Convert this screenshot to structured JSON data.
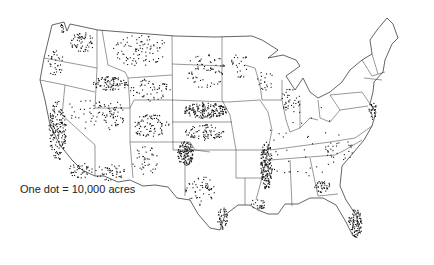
{
  "map": {
    "type": "dot-density",
    "region": "Contiguous United States",
    "legend": {
      "text": "One dot = 10,000 acres"
    },
    "colors": {
      "dots": "#111111",
      "borders": "#222222",
      "background": "#ffffff"
    },
    "clusters": [
      {
        "name": "washington-columbia-basin",
        "cx": 82,
        "cy": 42,
        "rx": 12,
        "ry": 10,
        "n": 60
      },
      {
        "name": "puget-sound",
        "cx": 63,
        "cy": 28,
        "rx": 4,
        "ry": 5,
        "n": 12
      },
      {
        "name": "oregon-willamette",
        "cx": 55,
        "cy": 62,
        "rx": 8,
        "ry": 14,
        "n": 35
      },
      {
        "name": "idaho-snake-river",
        "cx": 110,
        "cy": 83,
        "rx": 18,
        "ry": 7,
        "n": 90
      },
      {
        "name": "montana",
        "cx": 140,
        "cy": 50,
        "rx": 28,
        "ry": 16,
        "n": 90
      },
      {
        "name": "wyoming",
        "cx": 150,
        "cy": 90,
        "rx": 20,
        "ry": 12,
        "n": 55
      },
      {
        "name": "california-central-valley",
        "cx": 57,
        "cy": 130,
        "rx": 9,
        "ry": 30,
        "n": 170
      },
      {
        "name": "california-south",
        "cx": 80,
        "cy": 170,
        "rx": 12,
        "ry": 8,
        "n": 40
      },
      {
        "name": "nevada",
        "cx": 85,
        "cy": 110,
        "rx": 18,
        "ry": 18,
        "n": 35
      },
      {
        "name": "utah",
        "cx": 112,
        "cy": 115,
        "rx": 12,
        "ry": 15,
        "n": 55
      },
      {
        "name": "arizona",
        "cx": 110,
        "cy": 172,
        "rx": 16,
        "ry": 8,
        "n": 45
      },
      {
        "name": "colorado",
        "cx": 150,
        "cy": 125,
        "rx": 20,
        "ry": 12,
        "n": 85
      },
      {
        "name": "new-mexico",
        "cx": 145,
        "cy": 160,
        "rx": 14,
        "ry": 14,
        "n": 40
      },
      {
        "name": "nebraska-platte",
        "cx": 205,
        "cy": 110,
        "rx": 22,
        "ry": 8,
        "n": 180
      },
      {
        "name": "kansas",
        "cx": 205,
        "cy": 132,
        "rx": 20,
        "ry": 8,
        "n": 80
      },
      {
        "name": "texas-high-plains",
        "cx": 185,
        "cy": 153,
        "rx": 8,
        "ry": 12,
        "n": 130
      },
      {
        "name": "texas-south",
        "cx": 200,
        "cy": 190,
        "rx": 15,
        "ry": 15,
        "n": 55
      },
      {
        "name": "texas-gulf-coast",
        "cx": 222,
        "cy": 218,
        "rx": 5,
        "ry": 12,
        "n": 45
      },
      {
        "name": "dakotas",
        "cx": 205,
        "cy": 70,
        "rx": 20,
        "ry": 18,
        "n": 70
      },
      {
        "name": "minnesota",
        "cx": 240,
        "cy": 65,
        "rx": 10,
        "ry": 12,
        "n": 25
      },
      {
        "name": "mississippi-delta",
        "cx": 266,
        "cy": 165,
        "rx": 6,
        "ry": 24,
        "n": 170
      },
      {
        "name": "louisiana",
        "cx": 258,
        "cy": 203,
        "rx": 8,
        "ry": 6,
        "n": 25
      },
      {
        "name": "michigan-indiana",
        "cx": 290,
        "cy": 100,
        "rx": 10,
        "ry": 12,
        "n": 35
      },
      {
        "name": "wisconsin",
        "cx": 265,
        "cy": 80,
        "rx": 8,
        "ry": 10,
        "n": 20
      },
      {
        "name": "georgia-south",
        "cx": 322,
        "cy": 186,
        "rx": 8,
        "ry": 6,
        "n": 40
      },
      {
        "name": "florida",
        "cx": 355,
        "cy": 223,
        "rx": 7,
        "ry": 14,
        "n": 90
      },
      {
        "name": "delmarva",
        "cx": 372,
        "cy": 110,
        "rx": 4,
        "ry": 9,
        "n": 30
      },
      {
        "name": "carolinas",
        "cx": 340,
        "cy": 150,
        "rx": 15,
        "ry": 10,
        "n": 25
      },
      {
        "name": "scattered-east",
        "cx": 300,
        "cy": 140,
        "rx": 40,
        "ry": 40,
        "n": 40
      }
    ]
  }
}
